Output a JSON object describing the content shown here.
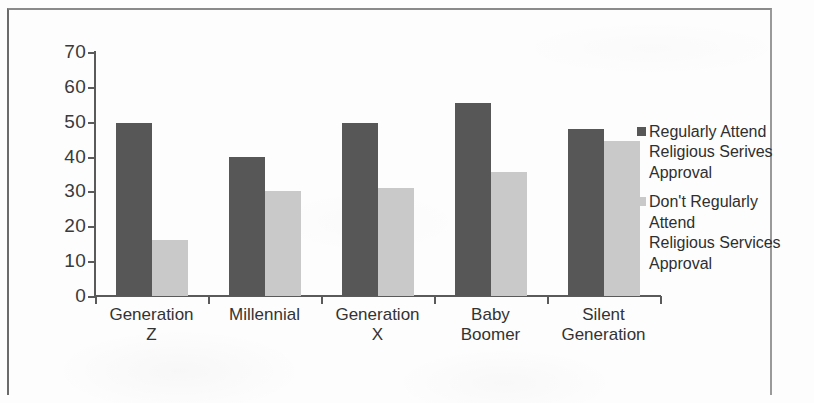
{
  "chart_data": {
    "type": "bar",
    "title": "",
    "subtitle": "",
    "xlabel": "",
    "ylabel": "",
    "ylim": [
      0,
      70
    ],
    "yticks": [
      0,
      10,
      20,
      30,
      40,
      50,
      60,
      70
    ],
    "grid": false,
    "legend_position": "right",
    "categories": [
      "Generation Z",
      "Millennial",
      "Generation X",
      "Baby Boomer",
      "Silent\nGeneration"
    ],
    "series": [
      {
        "name": "Regularly Attend Religious Serives Approval",
        "legend_label": "Regularly Attend\nReligious Serives\nApproval",
        "color": "#575757",
        "values": [
          49.5,
          40,
          49.5,
          55.5,
          48
        ]
      },
      {
        "name": "Don't Regularly Attend Religious Services Approval",
        "legend_label": "Don't Regularly Attend\nReligious Services\nApproval",
        "color": "#c9c9c9",
        "values": [
          16,
          30,
          31,
          35.5,
          44.5
        ]
      }
    ]
  },
  "colors": {
    "series_dark": "#575757",
    "series_light": "#c9c9c9",
    "axis": "#5a5a5a",
    "text": "#333333",
    "frame": "#6b6b6b",
    "background": "#fdfdfd"
  }
}
